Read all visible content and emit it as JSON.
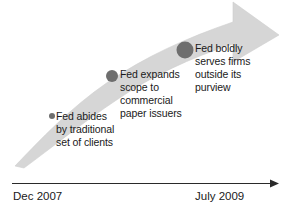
{
  "diagram": {
    "type": "timeline-arrow",
    "title": "",
    "colors": {
      "band": "#d4d4d4",
      "band_edge": "#c9c9c9",
      "dot": "#6e6e6e",
      "axis": "#2a2a2a",
      "text": "#1a1a1a",
      "background": "#ffffff"
    },
    "growth_arrow": {
      "name": "upward-trend-arrow",
      "direction": "lower-left to upper-right",
      "tail_width_px": 2,
      "head_width_px": 46
    },
    "milestones": [
      {
        "id": "milestone-1",
        "order": 1,
        "dot_radius_px": 3,
        "dot_cx": 52,
        "dot_cy": 116,
        "text": "Fed abides\nby traditional\nset of clients"
      },
      {
        "id": "milestone-2",
        "order": 2,
        "dot_radius_px": 6,
        "dot_cx": 112,
        "dot_cy": 76,
        "text": "Fed expands\nscope to\ncommercial\npaper issuers"
      },
      {
        "id": "milestone-3",
        "order": 3,
        "dot_radius_px": 8.5,
        "dot_cx": 185,
        "dot_cy": 50,
        "text": "Fed boldly\nserves firms\noutside its\npurview"
      }
    ],
    "axis": {
      "name": "time-axis",
      "orientation": "horizontal",
      "has_arrowhead": true,
      "start_label": "Dec 2007",
      "end_label": "July 2009",
      "y_px": 183,
      "x_start_px": 12,
      "x_end_px": 278
    }
  }
}
